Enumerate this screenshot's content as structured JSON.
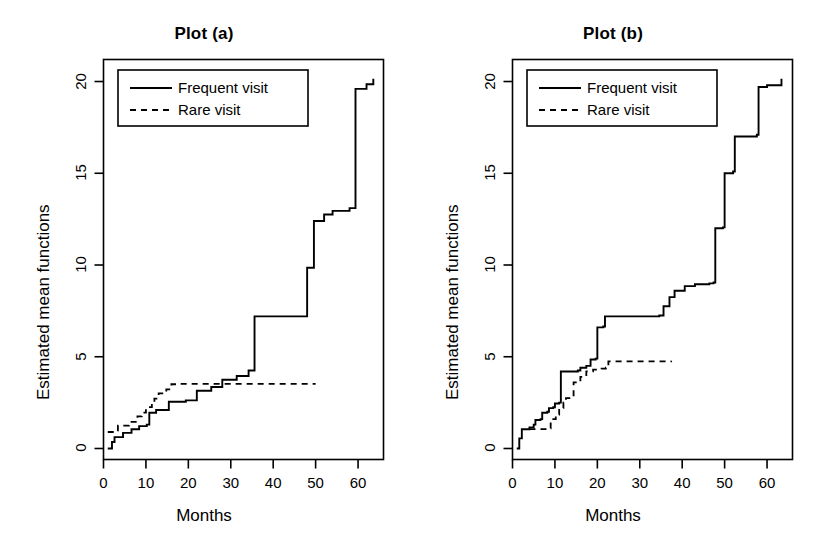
{
  "figure": {
    "width": 817,
    "height": 553,
    "background": "#ffffff",
    "ink_color": "#000000"
  },
  "chart_data": [
    {
      "type": "line",
      "panel_id": "a",
      "title": "Plot (a)",
      "xlabel": "Months",
      "ylabel": "Estimated mean functions",
      "xlim": [
        0,
        66
      ],
      "ylim": [
        -0.6,
        21.2
      ],
      "xticks": [
        0,
        10,
        20,
        30,
        40,
        50,
        60
      ],
      "yticks": [
        0,
        5,
        10,
        15,
        20
      ],
      "xtick_labels": [
        "0",
        "10",
        "20",
        "30",
        "40",
        "50",
        "60"
      ],
      "ytick_labels": [
        "0",
        "5",
        "10",
        "15",
        "20"
      ],
      "grid": false,
      "legend": {
        "position": "top-left",
        "entries": [
          {
            "label": "Frequent visit",
            "style": "solid"
          },
          {
            "label": "Rare visit",
            "style": "dashed"
          }
        ]
      },
      "series": [
        {
          "name": "Frequent visit",
          "style": "solid",
          "step": "post",
          "points": [
            [
              1.0,
              0.0
            ],
            [
              2.0,
              0.35
            ],
            [
              2.6,
              0.62
            ],
            [
              4.0,
              0.62
            ],
            [
              4.6,
              0.85
            ],
            [
              6.0,
              0.85
            ],
            [
              6.6,
              1.05
            ],
            [
              8.0,
              1.05
            ],
            [
              8.4,
              1.22
            ],
            [
              9.6,
              1.22
            ],
            [
              10.2,
              1.3
            ],
            [
              10.6,
              1.3
            ],
            [
              10.8,
              1.95
            ],
            [
              12.0,
              1.95
            ],
            [
              12.4,
              2.1
            ],
            [
              15.0,
              2.1
            ],
            [
              15.4,
              2.55
            ],
            [
              19.0,
              2.55
            ],
            [
              19.4,
              2.62
            ],
            [
              21.6,
              2.62
            ],
            [
              22.0,
              3.15
            ],
            [
              25.0,
              3.15
            ],
            [
              25.4,
              3.35
            ],
            [
              27.6,
              3.35
            ],
            [
              28.0,
              3.75
            ],
            [
              31.0,
              3.75
            ],
            [
              31.4,
              3.95
            ],
            [
              33.8,
              3.95
            ],
            [
              34.2,
              4.25
            ],
            [
              35.4,
              4.25
            ],
            [
              35.6,
              7.2
            ],
            [
              47.6,
              7.2
            ],
            [
              48.0,
              9.85
            ],
            [
              49.2,
              9.85
            ],
            [
              49.6,
              12.4
            ],
            [
              51.4,
              12.4
            ],
            [
              52.0,
              12.75
            ],
            [
              54.0,
              12.95
            ],
            [
              58.0,
              13.1
            ],
            [
              59.0,
              13.1
            ],
            [
              59.4,
              19.6
            ],
            [
              62.0,
              19.85
            ],
            [
              63.6,
              20.15
            ]
          ]
        },
        {
          "name": "Rare visit",
          "style": "dashed",
          "step": "post",
          "points": [
            [
              1.0,
              0.9
            ],
            [
              3.0,
              0.92
            ],
            [
              3.4,
              1.25
            ],
            [
              6.0,
              1.45
            ],
            [
              8.0,
              1.75
            ],
            [
              9.0,
              1.95
            ],
            [
              10.0,
              2.15
            ],
            [
              10.4,
              2.25
            ],
            [
              11.4,
              2.55
            ],
            [
              12.0,
              2.72
            ],
            [
              12.6,
              2.72
            ],
            [
              13.0,
              3.0
            ],
            [
              14.8,
              3.22
            ],
            [
              16.0,
              3.5
            ],
            [
              17.2,
              3.52
            ],
            [
              50.0,
              3.52
            ]
          ]
        }
      ]
    },
    {
      "type": "line",
      "panel_id": "b",
      "title": "Plot (b)",
      "xlabel": "Months",
      "ylabel": "Estimated mean functions",
      "xlim": [
        0,
        66
      ],
      "ylim": [
        -0.6,
        21.2
      ],
      "xticks": [
        0,
        10,
        20,
        30,
        40,
        50,
        60
      ],
      "yticks": [
        0,
        5,
        10,
        15,
        20
      ],
      "xtick_labels": [
        "0",
        "10",
        "20",
        "30",
        "40",
        "50",
        "60"
      ],
      "ytick_labels": [
        "0",
        "5",
        "10",
        "15",
        "20"
      ],
      "grid": false,
      "legend": {
        "position": "top-left",
        "entries": [
          {
            "label": "Frequent visit",
            "style": "solid"
          },
          {
            "label": "Rare visit",
            "style": "dashed"
          }
        ]
      },
      "series": [
        {
          "name": "Frequent visit",
          "style": "solid",
          "step": "post",
          "points": [
            [
              1.0,
              0.0
            ],
            [
              1.6,
              0.55
            ],
            [
              2.2,
              1.05
            ],
            [
              4.0,
              1.15
            ],
            [
              5.0,
              1.3
            ],
            [
              5.4,
              1.55
            ],
            [
              6.6,
              1.6
            ],
            [
              7.0,
              1.95
            ],
            [
              8.2,
              2.0
            ],
            [
              8.6,
              2.2
            ],
            [
              9.6,
              2.25
            ],
            [
              10.0,
              2.45
            ],
            [
              11.0,
              2.5
            ],
            [
              11.4,
              4.2
            ],
            [
              15.4,
              4.25
            ],
            [
              16.0,
              4.4
            ],
            [
              17.4,
              4.5
            ],
            [
              18.4,
              4.85
            ],
            [
              19.6,
              4.9
            ],
            [
              20.0,
              6.6
            ],
            [
              21.4,
              6.65
            ],
            [
              21.8,
              7.2
            ],
            [
              34.6,
              7.25
            ],
            [
              35.6,
              7.75
            ],
            [
              37.0,
              8.25
            ],
            [
              38.2,
              8.6
            ],
            [
              40.6,
              8.85
            ],
            [
              43.0,
              8.95
            ],
            [
              46.4,
              9.0
            ],
            [
              47.4,
              9.05
            ],
            [
              47.8,
              12.0
            ],
            [
              49.6,
              12.05
            ],
            [
              50.0,
              15.0
            ],
            [
              52.0,
              15.1
            ],
            [
              52.4,
              17.0
            ],
            [
              57.6,
              17.1
            ],
            [
              58.0,
              19.7
            ],
            [
              60.0,
              19.8
            ],
            [
              63.4,
              20.15
            ]
          ]
        },
        {
          "name": "Rare visit",
          "style": "dashed",
          "step": "post",
          "points": [
            [
              4.0,
              1.05
            ],
            [
              8.4,
              1.1
            ],
            [
              9.0,
              1.6
            ],
            [
              10.2,
              1.85
            ],
            [
              11.0,
              2.2
            ],
            [
              12.0,
              2.5
            ],
            [
              12.6,
              2.75
            ],
            [
              14.0,
              2.8
            ],
            [
              14.4,
              3.6
            ],
            [
              16.0,
              3.9
            ],
            [
              17.4,
              4.2
            ],
            [
              19.0,
              4.3
            ],
            [
              21.0,
              4.35
            ],
            [
              22.0,
              4.4
            ],
            [
              22.6,
              4.75
            ],
            [
              37.4,
              4.78
            ]
          ]
        }
      ]
    }
  ]
}
